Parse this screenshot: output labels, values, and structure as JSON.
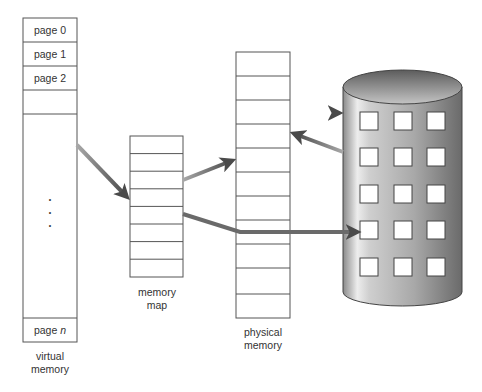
{
  "virtual_memory": {
    "label_line1": "virtual",
    "label_line2": "memory",
    "pages": [
      "page 0",
      "page 1",
      "page 2"
    ],
    "last_page_prefix": "page ",
    "last_page_var": "n",
    "ellipsis": "•"
  },
  "memory_map": {
    "label_line1": "memory",
    "label_line2": "map",
    "rows": 8
  },
  "physical_memory": {
    "label_line1": "physical",
    "label_line2": "memory",
    "rows": 11
  },
  "disk": {
    "type": "cylinder",
    "block_rows": 5,
    "block_cols": 3
  },
  "colors": {
    "line": "#555555",
    "arrow": "#5a5a5a",
    "arrow_light": "#9a9a9a",
    "disk_dark": "#6e6e6e",
    "disk_light": "#e8e8e8"
  }
}
